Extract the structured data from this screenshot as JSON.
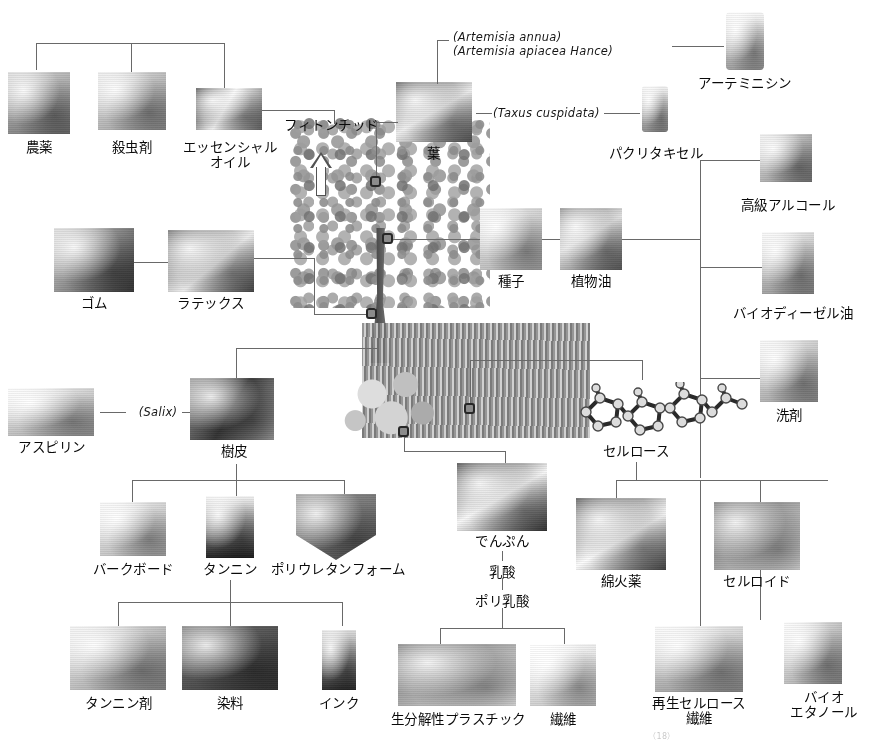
{
  "figure": {
    "kind": "plant-resource-utilization-tree-diagram",
    "language": "ja",
    "credit": "（18）"
  },
  "scientific_names": {
    "artemisia_annua": "(Artemisia annua)",
    "artemisia_apiacea": "(Artemisia apiacea Hance)",
    "taxus_cuspidata": "(Taxus cuspidata)",
    "salix": "(Salix)"
  },
  "nodes": {
    "noyaku": "農薬",
    "satchuzai": "殺虫剤",
    "essential_oil": "エッセンシャル\nオイル",
    "phytoncide": "フィトンチッド",
    "leaf": "葉",
    "artemisinin": "アーテミニシン",
    "paclitaxel": "パクリタキセル",
    "higher_alcohol": "高級アルコール",
    "biodiesel": "バイオディーゼル油",
    "detergent": "洗剤",
    "gum": "ゴム",
    "latex": "ラテックス",
    "seed": "種子",
    "vegetable_oil": "植物油",
    "aspirin": "アスピリン",
    "bark": "樹皮",
    "bark_board": "バークボード",
    "tannin": "タンニン",
    "polyurethane_foam": "ポリウレタンフォーム",
    "tannin_agent": "タンニン剤",
    "dye": "染料",
    "ink": "インク",
    "starch": "でんぷん",
    "lactic_acid": "乳酸",
    "polylactic_acid": "ポリ乳酸",
    "biodegradable_plastic": "生分解性プラスチック",
    "fiber": "繊維",
    "cellulose": "セルロース",
    "guncotton": "綿火薬",
    "celluloid": "セルロイド",
    "regenerated_cellulose_fiber": "再生セルロース\n繊維",
    "bioethanol": "バイオ\nエタノール"
  },
  "colors": {
    "line": "#6a6a6a",
    "dot_border": "#2b2b2b",
    "text": "#101010",
    "background": "#ffffff"
  }
}
